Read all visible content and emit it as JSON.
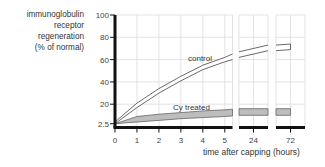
{
  "chart_data": {
    "type": "line",
    "title": "",
    "ylabel_lines": [
      "immunoglobulin",
      "receptor",
      "regeneration",
      "(% of normal)"
    ],
    "xlabel": "time after capping (hours)",
    "yticks": [
      {
        "value": 2.5,
        "label": "2.5"
      },
      {
        "value": 20,
        "label": "20"
      },
      {
        "value": 40,
        "label": "40"
      },
      {
        "value": 60,
        "label": "60"
      },
      {
        "value": 80,
        "label": "80"
      },
      {
        "value": 100,
        "label": "100"
      }
    ],
    "ylim": [
      0,
      100
    ],
    "grid": true,
    "x_segments": [
      {
        "xlim": [
          0,
          5.35
        ],
        "ticks": [
          {
            "value": 0,
            "label": "0"
          },
          {
            "value": 1,
            "label": "1"
          },
          {
            "value": 2,
            "label": "2"
          },
          {
            "value": 3,
            "label": "3"
          },
          {
            "value": 4,
            "label": "4"
          },
          {
            "value": 5,
            "label": "5"
          }
        ]
      },
      {
        "xlim": [
          22,
          26
        ],
        "ticks": [
          {
            "value": 24,
            "label": "24"
          }
        ]
      },
      {
        "xlim": [
          70,
          74
        ],
        "ticks": [
          {
            "value": 72,
            "label": "72"
          }
        ]
      }
    ],
    "series": [
      {
        "name": "control",
        "style": "double-line",
        "upper": {
          "x": [
            0,
            1,
            2,
            3,
            4,
            5,
            5.35,
            22,
            26,
            70,
            72
          ],
          "y": [
            4,
            21,
            34,
            45,
            55,
            62,
            65,
            67,
            73,
            73,
            74
          ]
        },
        "lower": {
          "x": [
            0,
            1,
            2,
            3,
            4,
            5,
            5.35,
            22,
            26,
            70,
            72
          ],
          "y": [
            2.5,
            17,
            30,
            41,
            51,
            58,
            60,
            62,
            68,
            68,
            69
          ]
        }
      },
      {
        "name": "Cy treated",
        "style": "shaded-band",
        "fill": "#bdbdbd",
        "upper": {
          "x": [
            0,
            1,
            2,
            3,
            4,
            5,
            5.35,
            22,
            26,
            70,
            72
          ],
          "y": [
            2.5,
            9,
            11,
            12.5,
            14,
            15,
            15.5,
            16,
            16,
            16,
            16
          ]
        },
        "lower": {
          "x": [
            0,
            1,
            2,
            3,
            4,
            5,
            5.35,
            22,
            26,
            70,
            72
          ],
          "y": [
            2.5,
            4,
            5.5,
            7,
            8,
            9,
            9.5,
            10,
            10,
            10,
            10
          ]
        }
      }
    ]
  }
}
